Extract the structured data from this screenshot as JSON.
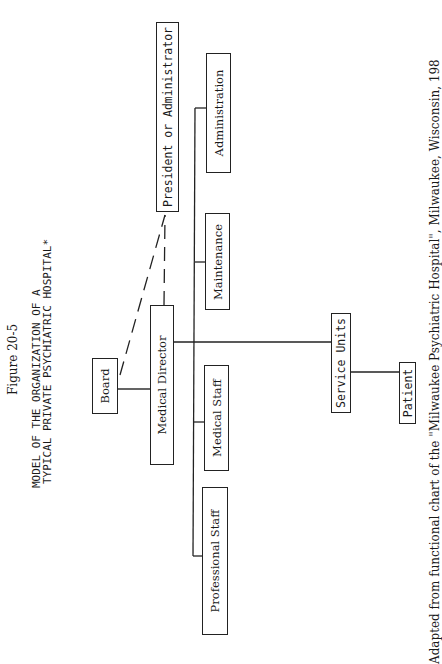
{
  "figure": {
    "label": "Figure 20-5",
    "title_line1": "MODEL OF THE ORGANIZATION OF A",
    "title_line2": "TYPICAL PRIVATE PSYCHIATRIC HOSPITAL*"
  },
  "nodes": {
    "board": "Board",
    "medical_director": "Medical Director",
    "president": "President or Administrator",
    "administration": "Administration",
    "maintenance": "Maintenance",
    "medical_staff": "Medical Staff",
    "professional_staff": "Professional Staff",
    "service_units": "Service Units",
    "patient": "Patient"
  },
  "edges": [
    {
      "from": "Board",
      "to": "Medical Director",
      "style": "solid"
    },
    {
      "from": "Board",
      "to": "President or Administrator",
      "style": "dashed"
    },
    {
      "from": "Medical Director",
      "to": "President or Administrator",
      "style": "dashed"
    },
    {
      "from": "Medical Director",
      "to": "Administration",
      "style": "solid"
    },
    {
      "from": "Medical Director",
      "to": "Maintenance",
      "style": "solid"
    },
    {
      "from": "Medical Director",
      "to": "Medical Staff",
      "style": "solid"
    },
    {
      "from": "Medical Director",
      "to": "Professional Staff",
      "style": "solid"
    },
    {
      "from": "Medical Director",
      "to": "Service Units",
      "style": "solid"
    },
    {
      "from": "Service Units",
      "to": "Patient",
      "style": "solid"
    }
  ],
  "footnote": "Adapted from functional chart of the \"Milwaukee Psychiatric Hospital\", Milwaukee, Wisconsin, 198"
}
